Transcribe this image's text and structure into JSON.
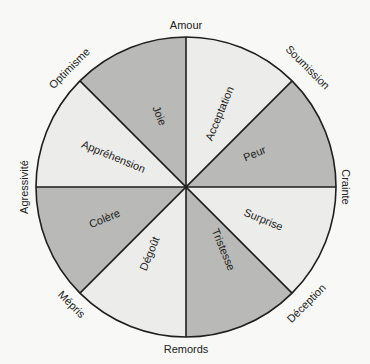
{
  "diagram": {
    "colors": {
      "dark": "#b9b9b7",
      "light": "#ececea",
      "stroke": "#1e1e1e",
      "background": "#f8f8f6"
    },
    "sectors": [
      {
        "label": "Acceptation",
        "shade": "light"
      },
      {
        "label": "Peur",
        "shade": "dark"
      },
      {
        "label": "Surprise",
        "shade": "light"
      },
      {
        "label": "Tristesse",
        "shade": "dark"
      },
      {
        "label": "Dégoût",
        "shade": "light"
      },
      {
        "label": "Colère",
        "shade": "dark"
      },
      {
        "label": "Appréhension",
        "shade": "light"
      },
      {
        "label": "Joie",
        "shade": "dark"
      }
    ],
    "outer_labels": [
      {
        "label": "Amour"
      },
      {
        "label": "Soumission"
      },
      {
        "label": "Crainte"
      },
      {
        "label": "Déception"
      },
      {
        "label": "Remords"
      },
      {
        "label": "Mépris"
      },
      {
        "label": "Agressivité"
      },
      {
        "label": "Optimisme"
      }
    ]
  }
}
